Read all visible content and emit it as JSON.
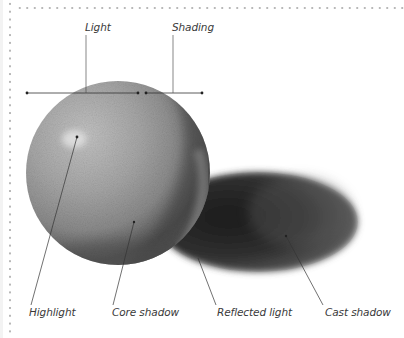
{
  "illustration": {
    "subject": "Shaded sphere with cast shadow",
    "colors": {
      "background": "#ffffff",
      "frame_dots": "#b8b8b8",
      "leader_lines": "#333333",
      "label_text": "#3a3a3a",
      "sphere_light": "#a9a9a9",
      "sphere_shadow": "#4a4a4a",
      "cast_shadow": "#2a2a2a"
    }
  },
  "labels": {
    "light": "Light",
    "shading": "Shading",
    "highlight": "Highlight",
    "core_shadow": "Core shadow",
    "reflected_light": "Reflected light",
    "cast_shadow": "Cast shadow"
  }
}
